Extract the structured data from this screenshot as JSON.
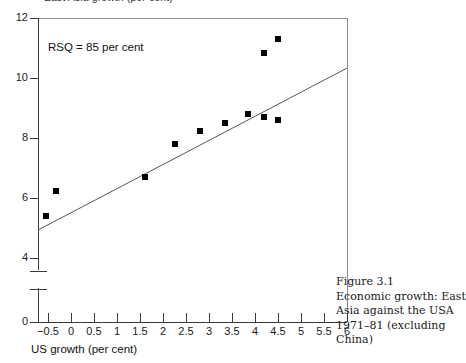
{
  "chart_data": {
    "type": "scatter",
    "title": "",
    "xlabel": "US growth (per cent)",
    "ylabel": "East Asia growth (per cent)",
    "xlim": [
      -0.75,
      6
    ],
    "ylim": [
      4,
      12
    ],
    "y_axis_break": true,
    "y_axis_origin_label": "0",
    "grid": false,
    "legend": null,
    "xticks": [
      "−0.5",
      "0",
      "0.5",
      "1",
      "1.5",
      "2",
      "2.5",
      "3",
      "3.5",
      "4",
      "4.5",
      "5",
      "5.5",
      "6"
    ],
    "xtick_values": [
      -0.5,
      0,
      0.5,
      1,
      1.5,
      2,
      2.5,
      3,
      3.5,
      4,
      4.5,
      5,
      5.5,
      6
    ],
    "yticks": [
      "0",
      "4",
      "6",
      "8",
      "10",
      "12"
    ],
    "ytick_values": [
      0,
      4,
      6,
      8,
      10,
      12
    ],
    "annotation": "RSQ = 85 per cent",
    "points": [
      {
        "x": -0.55,
        "y": 5.4
      },
      {
        "x": -0.33,
        "y": 6.25
      },
      {
        "x": 1.6,
        "y": 6.7
      },
      {
        "x": 2.25,
        "y": 7.8
      },
      {
        "x": 2.8,
        "y": 8.25
      },
      {
        "x": 3.35,
        "y": 8.5
      },
      {
        "x": 3.85,
        "y": 8.8
      },
      {
        "x": 4.2,
        "y": 8.7
      },
      {
        "x": 4.5,
        "y": 8.6
      },
      {
        "x": 4.2,
        "y": 10.85
      },
      {
        "x": 4.5,
        "y": 11.3
      }
    ],
    "fit_line": {
      "label": "regression line",
      "x_start": -0.72,
      "y_start": 4.93,
      "x_end": 6.0,
      "y_end": 10.33,
      "color": "#555555"
    },
    "marker_color": "#000000",
    "marker_shape": "square"
  },
  "axis_titles": {
    "y": "East Asia growth (per cent)",
    "x": "US growth (per cent)"
  },
  "annotation": {
    "rsq": "RSQ = 85 per cent"
  },
  "caption": {
    "figure_number": "Figure 3.1",
    "line1": "Economic growth: East",
    "line2": "Asia against the USA",
    "line3": "1971–81 (excluding",
    "line4": "China)"
  }
}
